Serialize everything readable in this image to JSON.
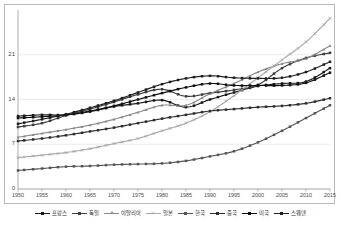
{
  "chart_data": {
    "type": "line",
    "title": "",
    "subtitle": "",
    "xlabel": "",
    "ylabel": "",
    "xlim": [
      1950,
      2015
    ],
    "ylim": [
      0,
      28
    ],
    "grid": true,
    "grid_axis": "y",
    "legend_position": "bottom",
    "x_ticks": [
      "1950",
      "1955",
      "1960",
      "1965",
      "1970",
      "1975",
      "1980",
      "1985",
      "1990",
      "1995",
      "2000",
      "2005",
      "2010",
      "2015"
    ],
    "y_ticks": [
      "0",
      "7",
      "14",
      "21"
    ],
    "x": [
      1950,
      1955,
      1960,
      1965,
      1970,
      1975,
      1980,
      1985,
      1990,
      1995,
      2000,
      2005,
      2010,
      2015
    ],
    "series": [
      {
        "name": "프랑스",
        "color": "#1a1a1a",
        "marker": "square",
        "values": [
          11.4,
          11.6,
          11.6,
          12.1,
          12.9,
          13.4,
          13.9,
          12.8,
          14.0,
          15.1,
          16.1,
          16.5,
          16.8,
          18.9
        ]
      },
      {
        "name": "독일",
        "color": "#3d3d3d",
        "marker": "square",
        "values": [
          9.7,
          10.3,
          11.5,
          12.5,
          13.6,
          14.8,
          15.6,
          14.5,
          15.0,
          15.5,
          16.3,
          18.9,
          20.5,
          21.3
        ]
      },
      {
        "name": "이탈리아",
        "color": "#8a8a8a",
        "marker": "triangle",
        "values": [
          8.1,
          8.7,
          9.3,
          10.0,
          10.9,
          12.0,
          13.1,
          13.1,
          14.9,
          16.5,
          18.3,
          19.6,
          20.4,
          22.4
        ]
      },
      {
        "name": "일본",
        "color": "#a8a8a8",
        "marker": "cross",
        "values": [
          4.9,
          5.3,
          5.7,
          6.3,
          7.1,
          7.9,
          9.1,
          10.3,
          12.1,
          14.6,
          17.4,
          20.2,
          23.0,
          26.7
        ]
      },
      {
        "name": "한국",
        "color": "#555555",
        "marker": "square",
        "values": [
          2.9,
          3.2,
          3.5,
          3.6,
          3.8,
          3.9,
          4.0,
          4.4,
          5.1,
          5.9,
          7.3,
          9.1,
          11.1,
          13.1
        ]
      },
      {
        "name": "중국",
        "color": "#2e2e2e",
        "marker": "square",
        "values": [
          7.5,
          7.9,
          8.4,
          9.0,
          9.6,
          10.3,
          11.0,
          11.6,
          12.2,
          12.5,
          12.8,
          13.0,
          13.4,
          14.2
        ]
      },
      {
        "name": "미국",
        "color": "#111111",
        "marker": "square",
        "values": [
          11.1,
          11.3,
          11.6,
          12.2,
          13.0,
          14.0,
          15.0,
          15.9,
          16.5,
          16.2,
          16.2,
          16.2,
          16.6,
          18.2
        ]
      },
      {
        "name": "스웨덴",
        "color": "#1f1f1f",
        "marker": "square",
        "values": [
          10.2,
          10.9,
          11.7,
          12.7,
          13.8,
          15.1,
          16.4,
          17.3,
          17.7,
          17.4,
          17.3,
          17.4,
          18.3,
          19.9
        ]
      }
    ]
  },
  "axes": {
    "y_labels": [
      {
        "text": "21",
        "value": 21
      },
      {
        "text": "14",
        "value": 14
      },
      {
        "text": "7",
        "value": 7
      },
      {
        "text": "0",
        "value": 0
      }
    ],
    "x_labels": [
      "1950",
      "1955",
      "1960",
      "1965",
      "1970",
      "1975",
      "1980",
      "1985",
      "1990",
      "1995",
      "2000",
      "2005",
      "2010",
      "2015"
    ]
  },
  "legend": {
    "items": [
      {
        "label": "프랑스",
        "color": "#1a1a1a",
        "marker": "square"
      },
      {
        "label": "독일",
        "color": "#3d3d3d",
        "marker": "square"
      },
      {
        "label": "이탈리아",
        "color": "#8a8a8a",
        "marker": "triangle"
      },
      {
        "label": "일본",
        "color": "#a8a8a8",
        "marker": "cross"
      },
      {
        "label": "한국",
        "color": "#555555",
        "marker": "square"
      },
      {
        "label": "중국",
        "color": "#2e2e2e",
        "marker": "square"
      },
      {
        "label": "미국",
        "color": "#111111",
        "marker": "square"
      },
      {
        "label": "스웨덴",
        "color": "#1f1f1f",
        "marker": "square"
      }
    ]
  },
  "style": {
    "plot_border_color": "#b9b9b9",
    "grid_color": "#e2e2e2",
    "axis_text_color": "#4a4a4a",
    "background": "#ffffff"
  }
}
